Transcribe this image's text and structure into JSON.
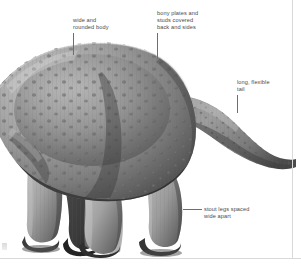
{
  "figure": {
    "background_color": "#ffffff",
    "frame_color": "#d9d9d9",
    "label_color": "#4a4a4a",
    "leader_color": "#6e6e6e"
  },
  "annotations": [
    {
      "id": "wide-rounded-body",
      "text": "wide and\nrounded body",
      "leader": "vertical"
    },
    {
      "id": "bony-plates-studs",
      "text": "bony plates and\nstuds covered\nback and sides",
      "leader": "vertical"
    },
    {
      "id": "long-flexible-tail",
      "text": "long, flexible\ntail",
      "leader": "vertical"
    },
    {
      "id": "stout-legs",
      "text": "stout legs spaced\nwide apart",
      "leader": "horizontal"
    }
  ],
  "illustration": {
    "body_fill_light": "#b9b9b9",
    "body_fill_mid": "#8e8e8e",
    "body_fill_dark": "#4f4f4f",
    "body_fill_deep": "#2d2d2d",
    "stud_color": "#5a5a5a"
  }
}
